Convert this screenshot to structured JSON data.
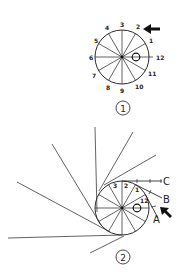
{
  "figure1": {
    "label": "1",
    "center_mark": "O",
    "clock_labels": [
      "12",
      "1",
      "2",
      "3",
      "4",
      "5",
      "6",
      "7",
      "8",
      "9",
      "10",
      "11"
    ],
    "arrow": "left-pointing-arrow"
  },
  "figure2": {
    "label": "2",
    "center_mark": "O",
    "clock_labels": [
      "3",
      "2",
      "1",
      "12"
    ],
    "point_labels": {
      "a": "A",
      "b": "B",
      "c": "C"
    },
    "arrow": "up-left-pointing-arrow"
  }
}
